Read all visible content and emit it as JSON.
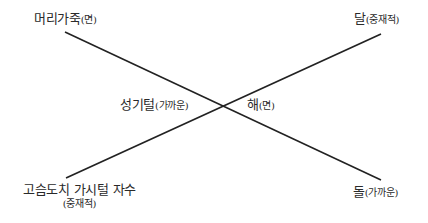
{
  "diagram": {
    "type": "crossing-lines",
    "line_color": "#222222",
    "lines": [
      {
        "from": "top_left",
        "to": "bottom_right",
        "x1": 65,
        "y1": 32,
        "x2": 381,
        "y2": 180
      },
      {
        "from": "bottom_left",
        "to": "top_right",
        "x1": 66,
        "y1": 178,
        "x2": 381,
        "y2": 34
      }
    ],
    "labels": {
      "top_left": {
        "main": "머리가죽",
        "sub": "(면)"
      },
      "top_right": {
        "main": "달",
        "sub": "(중재적)"
      },
      "center_left": {
        "main": "성기털",
        "sub": "(가까운)"
      },
      "center_right": {
        "main": "해",
        "sub": "(면)"
      },
      "bottom_left": {
        "main": "고슴도치 가시털 자수",
        "sub": "(중재적)"
      },
      "bottom_right": {
        "main": "돌",
        "sub": "(가까운)"
      }
    }
  }
}
